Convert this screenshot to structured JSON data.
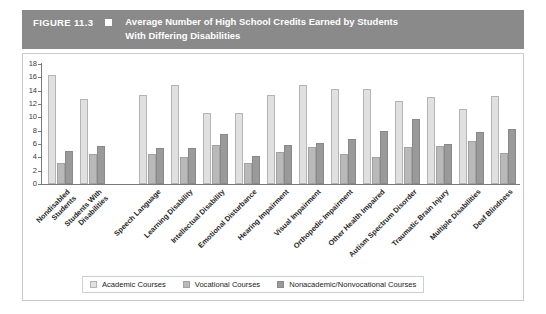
{
  "header": {
    "figure_number": "FIGURE 11.3",
    "bullet_icon": "square-bullet-icon",
    "title_line1": "Average Number of High School Credits Earned by Students",
    "title_line2": "With Differing Disabilities"
  },
  "colors": {
    "header_band": "#8a8a8a",
    "academic": "#e0e0e0",
    "vocational": "#b9b9b9",
    "nonacademic": "#9a9a9a",
    "axis": "#7a7a7a",
    "frame": "#c9c9c9"
  },
  "legend": {
    "position": "bottom",
    "items": [
      {
        "label": "Academic Courses",
        "swatch": "academic"
      },
      {
        "label": "Vocational Courses",
        "swatch": "vocational"
      },
      {
        "label": "Nonacademic/Nonvocational Courses",
        "swatch": "nonacademic"
      }
    ]
  },
  "chart_data": {
    "type": "bar",
    "title": "Average Number of High School Credits Earned by Students With Differing Disabilities",
    "xlabel": "",
    "ylabel": "",
    "ylim": [
      0,
      18
    ],
    "yticks": [
      0,
      2,
      4,
      6,
      8,
      10,
      12,
      14,
      16,
      18
    ],
    "ytick_labels": [
      "0",
      "2",
      "4",
      "6",
      "8",
      "10",
      "12",
      "14",
      "16",
      "18"
    ],
    "grid": false,
    "legend_position": "bottom",
    "category_label_rotation": -45,
    "group_gap_after_index": 1,
    "categories": [
      "Nondisabled Students",
      "Students With Disabilities",
      "Speech Language",
      "Learning Disability",
      "Intellectual Disability",
      "Emotional Disturbance",
      "Hearing Impairment",
      "Visual Impairment",
      "Orthopedic Impairment",
      "Other Health Impaired",
      "Autism Spectrum Disorder",
      "Traumatic Brain Injury",
      "Multiple Disabilities",
      "Deaf Blindness"
    ],
    "category_lines": [
      [
        "Nondisabled",
        "Students"
      ],
      [
        "Students With",
        "Disabilities"
      ],
      [
        "Speech Language"
      ],
      [
        "Learning Disability"
      ],
      [
        "Intellectual Disability"
      ],
      [
        "Emotional Disturbance"
      ],
      [
        "Hearing Impairment"
      ],
      [
        "Visual Impairment"
      ],
      [
        "Orthopedic Impairment"
      ],
      [
        "Other Health Impaired"
      ],
      [
        "Autism Spectrum Disorder"
      ],
      [
        "Traumatic Brain Injury"
      ],
      [
        "Multiple Disabilities"
      ],
      [
        "Deaf Blindness"
      ]
    ],
    "series": [
      {
        "name": "Academic Courses",
        "key": "academic",
        "color": "#e0e0e0",
        "values": [
          16.3,
          12.8,
          13.3,
          14.9,
          10.7,
          10.6,
          13.4,
          14.9,
          14.3,
          14.2,
          12.5,
          13.0,
          11.2,
          13.2
        ]
      },
      {
        "name": "Vocational Courses",
        "key": "vocational",
        "color": "#b9b9b9",
        "values": [
          3.2,
          4.5,
          4.5,
          4.1,
          5.9,
          3.2,
          4.8,
          5.5,
          4.5,
          4.0,
          5.5,
          5.7,
          6.5,
          4.7
        ]
      },
      {
        "name": "Nonacademic/Nonvocational Courses",
        "key": "nonacademic",
        "color": "#9a9a9a",
        "values": [
          5.0,
          5.7,
          5.4,
          5.4,
          7.5,
          4.2,
          5.9,
          6.2,
          6.8,
          8.0,
          9.8,
          6.0,
          7.8,
          8.2
        ]
      }
    ]
  }
}
